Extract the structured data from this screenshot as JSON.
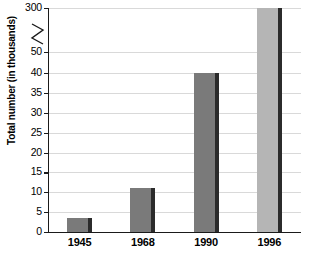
{
  "chart_data": {
    "type": "bar",
    "title": "",
    "xlabel": "",
    "ylabel": "Total number (in thousands)",
    "categories": [
      "1945",
      "1968",
      "1990",
      "1996"
    ],
    "values": [
      3.5,
      11,
      40,
      300
    ],
    "series": [
      {
        "name": "Total number (in thousands)",
        "values": [
          3.5,
          11,
          40,
          300
        ]
      }
    ],
    "ytick_labels": [
      "0",
      "5",
      "10",
      "15",
      "20",
      "25",
      "30",
      "35",
      "40",
      "50",
      "300"
    ],
    "ytick_values": [
      0,
      5,
      10,
      15,
      20,
      25,
      30,
      35,
      40,
      50,
      300
    ],
    "ylim": [
      0,
      300
    ],
    "axis_break": {
      "present": true,
      "between": [
        50,
        300
      ],
      "symbol": "zigzag"
    },
    "grid": true,
    "grid_orientation": "horizontal",
    "legend": false,
    "legend_position": "none",
    "bar_colors": [
      "#7a7a7a",
      "#7a7a7a",
      "#7a7a7a",
      "#b5b5b5"
    ],
    "bar_edge_color": "#2b2b2b",
    "gridline_color": "#d9d9d9",
    "axis_color": "#1a1a1a",
    "background_color": "#ffffff"
  }
}
